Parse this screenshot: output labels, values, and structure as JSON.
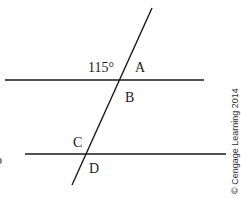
{
  "diagram": {
    "type": "parallel-lines-transversal",
    "angle_label": "115°",
    "labels": {
      "A": "A",
      "B": "B",
      "C": "C",
      "D": "D"
    },
    "copyright": "© Cengage Learning 2014",
    "edge_fragment": "o",
    "colors": {
      "line": "#1a1a1a",
      "background": "#ffffff"
    }
  }
}
